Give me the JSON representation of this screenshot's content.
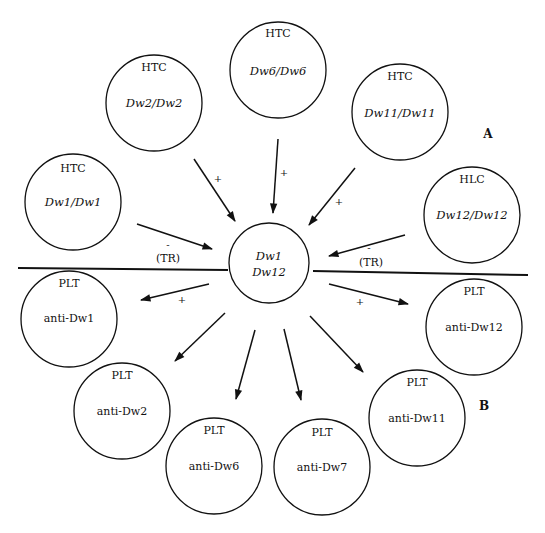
{
  "diagram": {
    "center": {
      "line1": "Dw1",
      "line2": "Dw12"
    },
    "panels": {
      "top": "A",
      "bottom": "B"
    },
    "top_nodes": [
      {
        "type": "HTC",
        "genotype": "Dw1/Dw1"
      },
      {
        "type": "HTC",
        "genotype": "Dw2/Dw2"
      },
      {
        "type": "HTC",
        "genotype": "Dw6/Dw6"
      },
      {
        "type": "HTC",
        "genotype": "Dw11/Dw11"
      },
      {
        "type": "HLC",
        "genotype": "Dw12/Dw12"
      }
    ],
    "bottom_nodes": [
      {
        "type": "PLT",
        "specificity": "anti-Dw1"
      },
      {
        "type": "PLT",
        "specificity": "anti-Dw2"
      },
      {
        "type": "PLT",
        "specificity": "anti-Dw6"
      },
      {
        "type": "PLT",
        "specificity": "anti-Dw7"
      },
      {
        "type": "PLT",
        "specificity": "anti-Dw11"
      },
      {
        "type": "PLT",
        "specificity": "anti-Dw12"
      }
    ],
    "arrow_labels": {
      "dw1_sign": "-",
      "dw1_note": "(TR)",
      "dw2_sign": "+",
      "dw6_sign": "+",
      "dw11_sign": "+",
      "dw12_sign": "-",
      "dw12_note": "(TR)",
      "anti_dw1_sign": "+",
      "anti_dw12_sign": "+"
    }
  }
}
